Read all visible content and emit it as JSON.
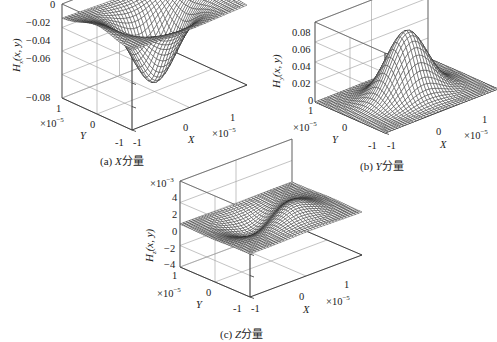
{
  "chart_data": [
    {
      "type": "surface",
      "id": "a",
      "caption": "(a) X 分量",
      "caption_letter": "(a)",
      "caption_var": "X",
      "caption_text": "分量",
      "zlabel_main": "H",
      "zlabel_sub": "x",
      "zlabel_args": "(x, y)",
      "xlabel": "X",
      "ylabel": "Y",
      "x_ticks": [
        "-1",
        "0",
        "1"
      ],
      "y_ticks": [
        "-1",
        "0",
        "1"
      ],
      "x_multiplier": "×10",
      "x_multiplier_exp": "−5",
      "y_multiplier": "×10",
      "y_multiplier_exp": "−5",
      "z_ticks": [
        "0",
        "−0.02",
        "−0.04",
        "−0.06",
        "−0.08"
      ],
      "z_multiplier": "",
      "zlim": [
        -0.08,
        0
      ],
      "xlim": [
        -1e-05,
        1e-05
      ],
      "ylim": [
        -1e-05,
        1e-05
      ],
      "description": "Negative Gaussian-like well; minimum ≈ −0.072 at center, edges near −0.01 with slight saddle rise along X edges",
      "peak_value": -0.072,
      "grid": true
    },
    {
      "type": "surface",
      "id": "b",
      "caption": "(b) Y 分量",
      "caption_letter": "(b)",
      "caption_var": "Y",
      "caption_text": "分量",
      "zlabel_main": "H",
      "zlabel_sub": "y",
      "zlabel_args": "(x, y)",
      "xlabel": "X",
      "ylabel": "Y",
      "x_ticks": [
        "-1",
        "0",
        "1"
      ],
      "y_ticks": [
        "-1",
        "0",
        "1"
      ],
      "x_multiplier": "×10",
      "x_multiplier_exp": "−5",
      "y_multiplier": "×10",
      "y_multiplier_exp": "−5",
      "z_ticks": [
        "0.08",
        "0.06",
        "0.04",
        "0.02",
        "0"
      ],
      "z_multiplier": "",
      "zlim": [
        0,
        0.08
      ],
      "xlim": [
        -1e-05,
        1e-05
      ],
      "ylim": [
        -1e-05,
        1e-05
      ],
      "description": "Positive Gaussian-like peak; maximum ≈ 0.065 at center, edges near 0",
      "peak_value": 0.065,
      "grid": true
    },
    {
      "type": "surface",
      "id": "c",
      "caption": "(c) Z 分量",
      "caption_letter": "(c)",
      "caption_var": "Z",
      "caption_text": "分量",
      "zlabel_main": "H",
      "zlabel_sub": "z",
      "zlabel_args": "(x, y)",
      "xlabel": "X",
      "ylabel": "Y",
      "x_ticks": [
        "-1",
        "0",
        "1"
      ],
      "y_ticks": [
        "-1",
        "0",
        "1"
      ],
      "x_multiplier": "×10",
      "x_multiplier_exp": "−5",
      "y_multiplier": "×10",
      "y_multiplier_exp": "−5",
      "z_ticks": [
        "4",
        "2",
        "0",
        "−2",
        "−4"
      ],
      "z_multiplier": "×10",
      "z_multiplier_exp": "−3",
      "zlim": [
        -0.004,
        0.004
      ],
      "xlim": [
        -1e-05,
        1e-05
      ],
      "ylim": [
        -1e-05,
        1e-05
      ],
      "description": "Antisymmetric dipole surface: positive lobe ≈ +0.002 on one side, negative lobe ≈ −0.002 on the other, zero along diagonal",
      "peak_value": 0.0022,
      "grid": true
    }
  ]
}
